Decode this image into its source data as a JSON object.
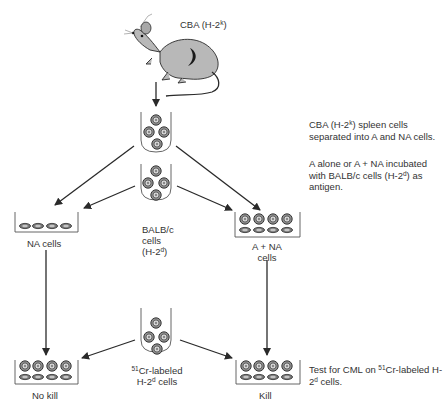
{
  "mouse": {
    "label_prefix": "CBA (H-2",
    "label_sup": "k",
    "label_suffix": ")"
  },
  "tubes": {
    "spleen": {
      "name": "cba-spleen-tube"
    },
    "balbc": {
      "line1": "BALB/c",
      "line2": "cells",
      "line3_prefix": "(H-2",
      "line3_sup": "d",
      "line3_suffix": ")"
    },
    "cr51": {
      "line1_sup": "51",
      "line1": "Cr-labeled",
      "line2_prefix": "H-2",
      "line2_sup": "d",
      "line2_suffix": " cells"
    }
  },
  "wells": {
    "na_cells": "NA cells",
    "a_na_line1": "A + NA",
    "a_na_line2": "cells",
    "no_kill": "No kill",
    "kill": "Kill"
  },
  "descriptions": {
    "step1_prefix": "CBA (H-2",
    "step1_sup": "k",
    "step1_suffix": ") spleen cells separated into A and NA cells.",
    "step2_prefix": "A alone or A + NA incubated with BALB/c cells (H-2",
    "step2_sup": "d",
    "step2_suffix": ") as antigen.",
    "step3_prefix": "Test for CML on ",
    "step3_sup": "51",
    "step3_mid": "Cr-labeled H-2",
    "step3_sup2": "d",
    "step3_suffix": " cells."
  },
  "colors": {
    "ink": "#2a2a2a",
    "mouse_fill": "#b8b8b8",
    "cell_fill": "#9a9a9a"
  }
}
